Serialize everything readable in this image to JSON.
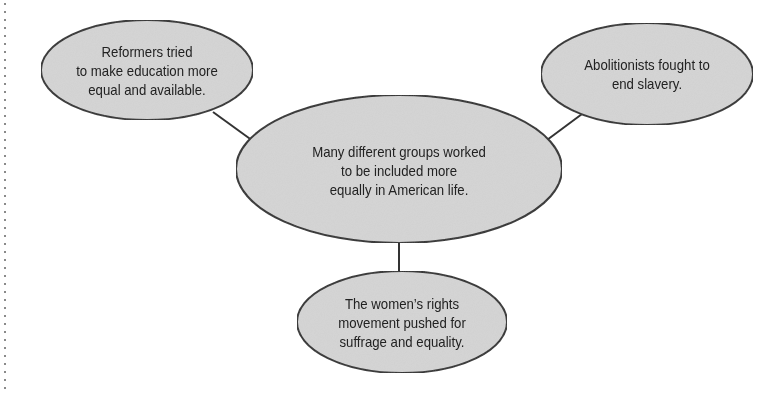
{
  "diagram": {
    "type": "concept-map",
    "style": {
      "fill": "#d4d4d4",
      "stroke": "#333333",
      "line": "#333333"
    },
    "center": {
      "text": "Many different groups worked\nto be included more\nequally in American life."
    },
    "nodes": [
      {
        "id": "education",
        "text": "Reformers tried\nto make education more\nequal and available."
      },
      {
        "id": "abolition",
        "text": "Abolitionists fought to\nend slavery."
      },
      {
        "id": "womens-rights",
        "text": "The women’s rights\nmovement pushed for\nsuffrage and equality."
      }
    ]
  }
}
